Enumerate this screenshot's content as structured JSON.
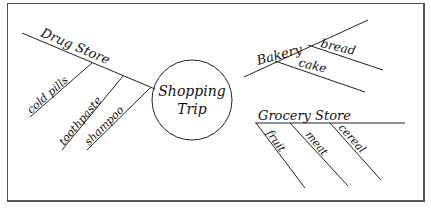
{
  "diagram": {
    "type": "mind-map",
    "center": {
      "label_line1": "Shopping",
      "label_line2": "Trip"
    },
    "branches": [
      {
        "label": "Drug Store",
        "children": [
          "cold pills",
          "toothpaste",
          "shampoo"
        ]
      },
      {
        "label": "Bakery",
        "children": [
          "bread",
          "cake"
        ]
      },
      {
        "label": "Grocery Store",
        "children": [
          "fruit",
          "meat",
          "cereal"
        ]
      }
    ]
  },
  "colors": {
    "ink": "#111111",
    "frame": "#555555",
    "background": "#ffffff"
  }
}
